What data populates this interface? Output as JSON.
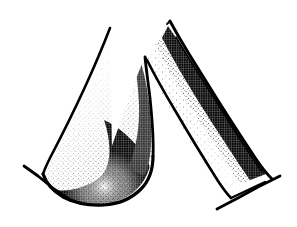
{
  "figure": {
    "title": "Stippled ink line drawing of two tapered structures",
    "style": "pen-and-ink stipple / hatching scientific illustration",
    "background_color": "#ffffff",
    "ink_color": "#000000",
    "canvas": {
      "width": 297,
      "height": 227
    },
    "labels": [],
    "caption": "",
    "shapes": [
      {
        "name": "left-broad-structure",
        "description": "Broad triangular form with a sharp upper apex, a long straight left edge, and a bulbous rounded lower-right lobe; interior graded stipple shading darkest along the right and lower-right margin.",
        "apex": [
          110,
          28
        ],
        "outline_path": "M110,28 L104,46 L86,90 L66,133 L50,163 L43,174 L48,186 L60,196 L78,203 L98,205 L117,202 L134,192 L145,179 L151,164 L152,146 L150,124 L148,100 L146,78 L145,57",
        "shading": {
          "type": "stipple",
          "gradient": "light-left to dark-right",
          "darkest_edge": "lower-right margin"
        }
      },
      {
        "name": "left-structure-inner-ridge",
        "description": "Sharp inner apex where the left structure's right margin meets the cleft between the two forms.",
        "apex": [
          145,
          57
        ]
      },
      {
        "name": "right-narrow-structure",
        "description": "Slender, gently curved tapering band descending from upper-left apex toward the lower right; stipple shading concentrated along its right margin with a lighter core.",
        "apex": [
          170,
          21
        ],
        "outer_path": "M170,21 L190,54 L213,92 L238,131 L258,160 L272,178",
        "inner_path": "M147,60 L166,93 L190,131 L212,163 L226,185 L232,196",
        "shading": {
          "type": "stipple",
          "gradient": "light-left to dark-right",
          "darkest_edge": "right margin"
        }
      },
      {
        "name": "left-base-tick",
        "description": "Short curved stroke crossing the base of the left structure, sweeping from upper-left down to the right.",
        "path": "M24,166 L38,176 L54,189 L70,200"
      },
      {
        "name": "right-base-tick",
        "description": "Short curved stroke crossing the base of the right structure, sweeping from lower-left up to the right.",
        "path": "M217,209 L238,198 L258,187 L280,176"
      }
    ]
  },
  "stipple": {
    "description": "Dense field of fine black dots producing tonal gradient shading inside both outlined forms.",
    "dot_color": "#000000"
  }
}
